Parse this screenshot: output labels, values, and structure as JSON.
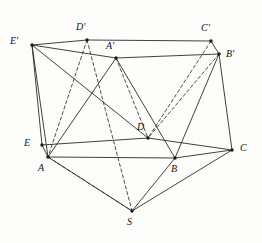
{
  "figure": {
    "width": 262,
    "height": 243,
    "background_color": "#fdfdfb",
    "line_color": "#2b2b2b",
    "dashed_line_color": "#3a3a3a",
    "vertex_color": "#1a1a1a"
  },
  "vertices": [
    {
      "id": "Ep",
      "label": "E'",
      "x": 32,
      "y": 45,
      "label_x": 10,
      "label_y": 36
    },
    {
      "id": "Dp",
      "label": "D'",
      "x": 87,
      "y": 40,
      "label_x": 76,
      "label_y": 22
    },
    {
      "id": "Cp",
      "label": "C'",
      "x": 211,
      "y": 41,
      "label_x": 201,
      "label_y": 23
    },
    {
      "id": "Bp",
      "label": "B'",
      "x": 219,
      "y": 54,
      "label_x": 226,
      "label_y": 49
    },
    {
      "id": "Ap",
      "label": "A'",
      "x": 116,
      "y": 58,
      "label_x": 106,
      "label_y": 41
    },
    {
      "id": "E",
      "label": "E",
      "x": 42,
      "y": 145,
      "label_x": 24,
      "label_y": 138
    },
    {
      "id": "D",
      "label": "D",
      "x": 148,
      "y": 138,
      "label_x": 137,
      "label_y": 122
    },
    {
      "id": "C",
      "label": "C",
      "x": 232,
      "y": 150,
      "label_x": 240,
      "label_y": 143
    },
    {
      "id": "B",
      "label": "B",
      "x": 175,
      "y": 158,
      "label_x": 171,
      "label_y": 164
    },
    {
      "id": "A",
      "label": "A",
      "x": 48,
      "y": 157,
      "label_x": 38,
      "label_y": 163
    },
    {
      "id": "S",
      "label": "S",
      "x": 132,
      "y": 211,
      "label_x": 127,
      "label_y": 217
    }
  ],
  "edges_solid": [
    {
      "name": "edge-Ep-Dp",
      "from": "Ep",
      "to": "Dp"
    },
    {
      "name": "edge-Dp-Cp",
      "from": "Dp",
      "to": "Cp"
    },
    {
      "name": "edge-Cp-Bp",
      "from": "Cp",
      "to": "Bp"
    },
    {
      "name": "edge-Ep-Ap",
      "from": "Ep",
      "to": "Ap"
    },
    {
      "name": "edge-Ap-Bp",
      "from": "Ap",
      "to": "Bp"
    },
    {
      "name": "edge-Ep-E",
      "from": "Ep",
      "to": "E"
    },
    {
      "name": "edge-Ep-A",
      "from": "Ep",
      "to": "A"
    },
    {
      "name": "edge-Bp-C",
      "from": "Bp",
      "to": "C"
    },
    {
      "name": "edge-Ap-A",
      "from": "Ap",
      "to": "A"
    },
    {
      "name": "edge-Ap-B",
      "from": "Ap",
      "to": "B"
    },
    {
      "name": "edge-E-D",
      "from": "E",
      "to": "D"
    },
    {
      "name": "edge-D-C",
      "from": "D",
      "to": "C"
    },
    {
      "name": "edge-E-A",
      "from": "E",
      "to": "A"
    },
    {
      "name": "edge-A-B",
      "from": "A",
      "to": "B"
    },
    {
      "name": "edge-B-C",
      "from": "B",
      "to": "C"
    },
    {
      "name": "edge-A-S",
      "from": "A",
      "to": "S"
    },
    {
      "name": "edge-B-S",
      "from": "B",
      "to": "S"
    },
    {
      "name": "edge-C-S",
      "from": "C",
      "to": "S"
    },
    {
      "name": "edge-Bp-B",
      "from": "Bp",
      "to": "B"
    },
    {
      "name": "edge-Ep-D",
      "from": "Ep",
      "to": "D"
    }
  ],
  "edges_dashed": [
    {
      "name": "dashed-Dp-A",
      "from": "Dp",
      "to": "A"
    },
    {
      "name": "dashed-Dp-S",
      "from": "Dp",
      "to": "S"
    },
    {
      "name": "dashed-Ap-D",
      "from": "Ap",
      "to": "D"
    },
    {
      "name": "dashed-Bp-D",
      "from": "Bp",
      "to": "D"
    },
    {
      "name": "dashed-Cp-D",
      "from": "Cp",
      "to": "D"
    },
    {
      "name": "dashed-A-S",
      "from": "A",
      "to": "S"
    }
  ]
}
